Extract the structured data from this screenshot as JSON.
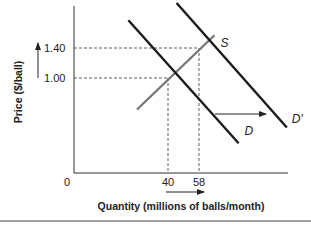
{
  "chart_data": {
    "type": "line",
    "title": "",
    "xlabel": "Quantity (millions of balls/month)",
    "ylabel": "Price ($/ball)",
    "origin_label": "0",
    "x_ticks": [
      40,
      58
    ],
    "y_ticks": [
      1.0,
      1.4
    ],
    "y_tick_labels": [
      "1.00",
      "1.40"
    ],
    "x_tick_labels": [
      "40",
      "58"
    ],
    "grid": false,
    "series": [
      {
        "name": "S",
        "label": "S",
        "color": "#777777",
        "points": [
          [
            22,
            0.58
          ],
          [
            67,
            1.57
          ]
        ]
      },
      {
        "name": "D",
        "label": "D",
        "color": "#1a1a1a",
        "points": [
          [
            17,
            1.77
          ],
          [
            81,
            0.13
          ]
        ]
      },
      {
        "name": "D'",
        "label": "D'",
        "color": "#1a1a1a",
        "points": [
          [
            45,
            2.0
          ],
          [
            109,
            0.34
          ]
        ]
      }
    ],
    "equilibria": [
      {
        "quantity": 40,
        "price": 1.0,
        "label": "original equilibrium"
      },
      {
        "quantity": 58,
        "price": 1.4,
        "label": "new equilibrium"
      }
    ],
    "annotations": [
      {
        "type": "arrow",
        "text": "demand shift right",
        "from_curve": "D",
        "to_curve": "D'"
      },
      {
        "type": "arrow",
        "text": "price rises",
        "axis": "y"
      },
      {
        "type": "arrow",
        "text": "quantity rises",
        "axis": "x"
      }
    ]
  }
}
